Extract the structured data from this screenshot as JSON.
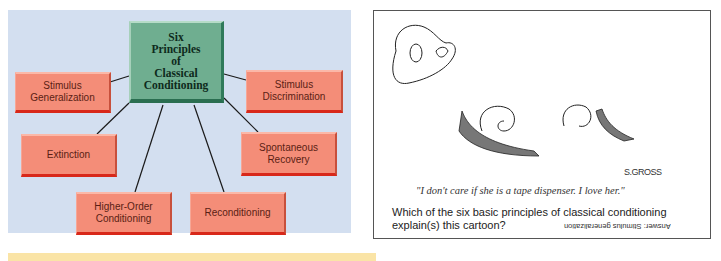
{
  "diagram": {
    "center": {
      "label": "Six\nPrinciples\nof\nClassical\nConditioning",
      "color": "#6fae90"
    },
    "nodes": [
      {
        "id": "stimulus-generalization",
        "label": "Stimulus Generalization"
      },
      {
        "id": "stimulus-discrimination",
        "label": "Stimulus Discrimination"
      },
      {
        "id": "extinction",
        "label": "Extinction"
      },
      {
        "id": "spontaneous-recovery",
        "label": "Spontaneous Recovery"
      },
      {
        "id": "higher-order-conditioning",
        "label": "Higher-Order Conditioning"
      },
      {
        "id": "reconditioning",
        "label": "Reconditioning"
      }
    ],
    "node_color": "#f48d78",
    "background": "#d3dff0"
  },
  "cartoon": {
    "caption": "\"I don't care if she is a tape dispenser.  I love her.\"",
    "signature": "S.GROSS",
    "question": "Which of the six basic principles of classical conditioning explain(s) this cartoon?",
    "answer": "Answer: Stimulus generalization"
  }
}
